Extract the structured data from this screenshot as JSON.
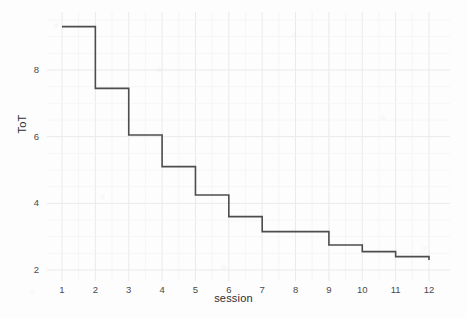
{
  "chart_data": {
    "type": "line",
    "style": "step",
    "title": "",
    "subtitle": "",
    "xlabel": "session",
    "ylabel": "ToT",
    "x": [
      1,
      2,
      3,
      4,
      5,
      6,
      7,
      8,
      9,
      10,
      11,
      12
    ],
    "values": [
      9.3,
      7.45,
      6.05,
      5.1,
      4.25,
      3.6,
      3.15,
      3.15,
      2.75,
      2.55,
      2.4,
      2.3
    ],
    "series": [
      {
        "name": "ToT",
        "values": [
          9.3,
          7.45,
          6.05,
          5.1,
          4.25,
          3.6,
          3.15,
          3.15,
          2.75,
          2.55,
          2.4,
          2.3
        ]
      }
    ],
    "xtick_labels": [
      "1",
      "2",
      "3",
      "4",
      "5",
      "6",
      "7",
      "8",
      "9",
      "10",
      "11",
      "12"
    ],
    "ytick_labels": [
      "2",
      "4",
      "6",
      "8"
    ],
    "ytick_values": [
      2,
      4,
      6,
      8
    ],
    "xlim": [
      1,
      12
    ],
    "ylim": [
      2.0,
      9.6
    ],
    "grid": true,
    "grid_minor": true,
    "legend": "none",
    "line_color": "#4d4d4d",
    "background_color": "#fdfdfd",
    "grid_color": "#eeeeee"
  },
  "axes": {
    "x_title": "session",
    "y_title": "ToT"
  }
}
